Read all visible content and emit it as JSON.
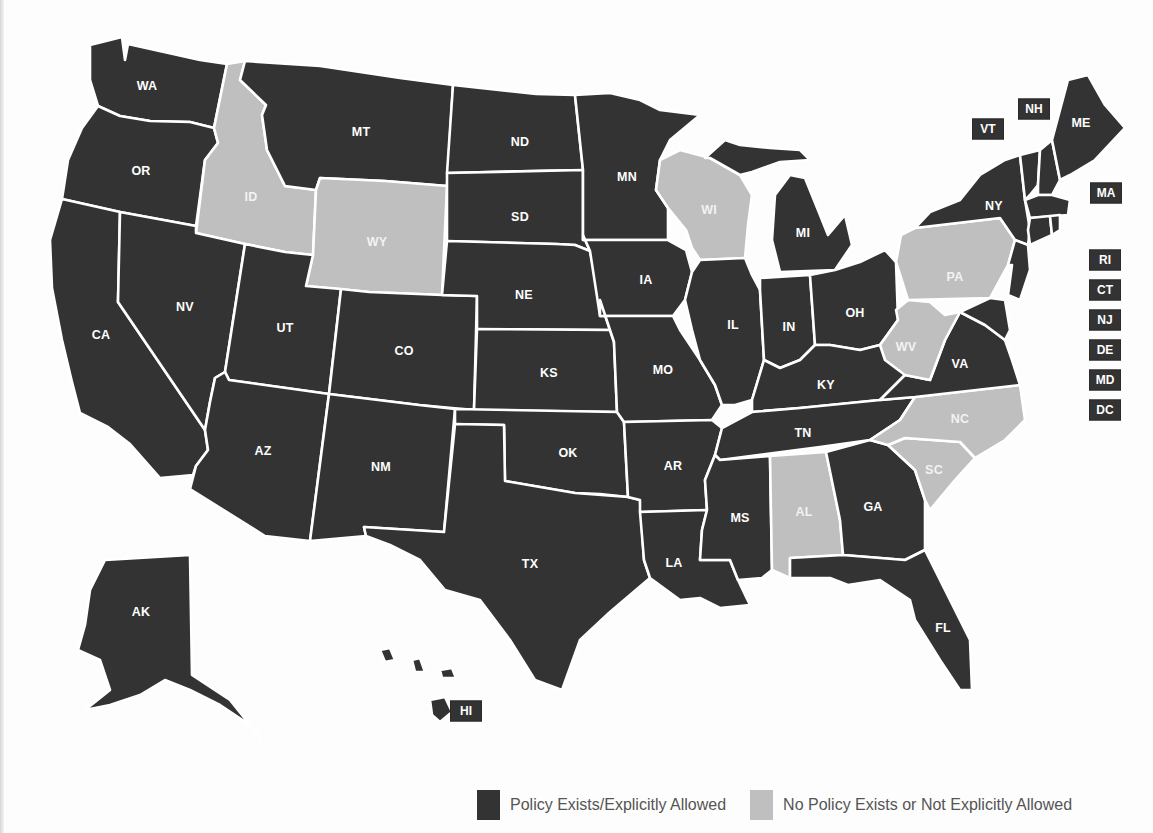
{
  "figure": {
    "title": "",
    "colors": {
      "policy_exists": "#333333",
      "no_policy": "#bfbfbf",
      "border": "#ffffff",
      "label_text": "#ffffff",
      "legend_text": "#555555"
    }
  },
  "legend": {
    "items": [
      {
        "key": "policy_exists",
        "label": "Policy Exists/Explicitly Allowed",
        "color": "#333333"
      },
      {
        "key": "no_policy",
        "label": "No Policy Exists or Not Explicitly Allowed",
        "color": "#bfbfbf"
      }
    ]
  },
  "chart_data": {
    "type": "choropleth",
    "title": "",
    "legend_position": "bottom-right",
    "categories": [
      "Policy Exists/Explicitly Allowed",
      "No Policy Exists or Not Explicitly Allowed"
    ],
    "states": [
      {
        "abbr": "WA",
        "status": "policy_exists"
      },
      {
        "abbr": "OR",
        "status": "policy_exists"
      },
      {
        "abbr": "CA",
        "status": "policy_exists"
      },
      {
        "abbr": "ID",
        "status": "no_policy"
      },
      {
        "abbr": "NV",
        "status": "policy_exists"
      },
      {
        "abbr": "MT",
        "status": "policy_exists"
      },
      {
        "abbr": "WY",
        "status": "no_policy"
      },
      {
        "abbr": "UT",
        "status": "policy_exists"
      },
      {
        "abbr": "AZ",
        "status": "policy_exists"
      },
      {
        "abbr": "CO",
        "status": "policy_exists"
      },
      {
        "abbr": "NM",
        "status": "policy_exists"
      },
      {
        "abbr": "ND",
        "status": "policy_exists"
      },
      {
        "abbr": "SD",
        "status": "policy_exists"
      },
      {
        "abbr": "NE",
        "status": "policy_exists"
      },
      {
        "abbr": "KS",
        "status": "policy_exists"
      },
      {
        "abbr": "OK",
        "status": "policy_exists"
      },
      {
        "abbr": "TX",
        "status": "policy_exists"
      },
      {
        "abbr": "MN",
        "status": "policy_exists"
      },
      {
        "abbr": "IA",
        "status": "policy_exists"
      },
      {
        "abbr": "MO",
        "status": "policy_exists"
      },
      {
        "abbr": "AR",
        "status": "policy_exists"
      },
      {
        "abbr": "LA",
        "status": "policy_exists"
      },
      {
        "abbr": "WI",
        "status": "no_policy"
      },
      {
        "abbr": "IL",
        "status": "policy_exists"
      },
      {
        "abbr": "MI",
        "status": "policy_exists"
      },
      {
        "abbr": "IN",
        "status": "policy_exists"
      },
      {
        "abbr": "OH",
        "status": "policy_exists"
      },
      {
        "abbr": "KY",
        "status": "policy_exists"
      },
      {
        "abbr": "TN",
        "status": "policy_exists"
      },
      {
        "abbr": "MS",
        "status": "policy_exists"
      },
      {
        "abbr": "AL",
        "status": "no_policy"
      },
      {
        "abbr": "GA",
        "status": "policy_exists"
      },
      {
        "abbr": "FL",
        "status": "policy_exists"
      },
      {
        "abbr": "SC",
        "status": "no_policy"
      },
      {
        "abbr": "NC",
        "status": "no_policy"
      },
      {
        "abbr": "VA",
        "status": "policy_exists"
      },
      {
        "abbr": "WV",
        "status": "no_policy"
      },
      {
        "abbr": "PA",
        "status": "no_policy"
      },
      {
        "abbr": "NY",
        "status": "policy_exists"
      },
      {
        "abbr": "ME",
        "status": "policy_exists"
      },
      {
        "abbr": "VT",
        "status": "policy_exists"
      },
      {
        "abbr": "NH",
        "status": "policy_exists"
      },
      {
        "abbr": "MA",
        "status": "policy_exists"
      },
      {
        "abbr": "RI",
        "status": "policy_exists"
      },
      {
        "abbr": "CT",
        "status": "policy_exists"
      },
      {
        "abbr": "NJ",
        "status": "policy_exists"
      },
      {
        "abbr": "DE",
        "status": "policy_exists"
      },
      {
        "abbr": "MD",
        "status": "policy_exists"
      },
      {
        "abbr": "DC",
        "status": "policy_exists"
      },
      {
        "abbr": "AK",
        "status": "policy_exists"
      },
      {
        "abbr": "HI",
        "status": "policy_exists"
      }
    ],
    "counts": {
      "policy_exists": 43,
      "no_policy": 8
    }
  },
  "map": {
    "labels": [
      {
        "abbr": "WA",
        "x": 147,
        "y": 86
      },
      {
        "abbr": "OR",
        "x": 141,
        "y": 171
      },
      {
        "abbr": "CA",
        "x": 101,
        "y": 335
      },
      {
        "abbr": "ID",
        "x": 251,
        "y": 197
      },
      {
        "abbr": "NV",
        "x": 185,
        "y": 307
      },
      {
        "abbr": "MT",
        "x": 361,
        "y": 132
      },
      {
        "abbr": "WY",
        "x": 377,
        "y": 242
      },
      {
        "abbr": "UT",
        "x": 285,
        "y": 328
      },
      {
        "abbr": "AZ",
        "x": 263,
        "y": 451
      },
      {
        "abbr": "CO",
        "x": 404,
        "y": 351
      },
      {
        "abbr": "NM",
        "x": 381,
        "y": 467
      },
      {
        "abbr": "ND",
        "x": 520,
        "y": 142
      },
      {
        "abbr": "SD",
        "x": 520,
        "y": 217
      },
      {
        "abbr": "NE",
        "x": 524,
        "y": 295
      },
      {
        "abbr": "KS",
        "x": 549,
        "y": 373
      },
      {
        "abbr": "OK",
        "x": 568,
        "y": 453
      },
      {
        "abbr": "TX",
        "x": 530,
        "y": 564
      },
      {
        "abbr": "MN",
        "x": 627,
        "y": 177
      },
      {
        "abbr": "IA",
        "x": 646,
        "y": 280
      },
      {
        "abbr": "MO",
        "x": 663,
        "y": 370
      },
      {
        "abbr": "AR",
        "x": 673,
        "y": 466
      },
      {
        "abbr": "LA",
        "x": 674,
        "y": 563
      },
      {
        "abbr": "WI",
        "x": 709,
        "y": 210
      },
      {
        "abbr": "IL",
        "x": 733,
        "y": 325
      },
      {
        "abbr": "MI",
        "x": 803,
        "y": 233
      },
      {
        "abbr": "IN",
        "x": 789,
        "y": 327
      },
      {
        "abbr": "OH",
        "x": 855,
        "y": 313
      },
      {
        "abbr": "KY",
        "x": 826,
        "y": 385
      },
      {
        "abbr": "TN",
        "x": 803,
        "y": 433
      },
      {
        "abbr": "MS",
        "x": 740,
        "y": 518
      },
      {
        "abbr": "AL",
        "x": 804,
        "y": 512
      },
      {
        "abbr": "GA",
        "x": 873,
        "y": 507
      },
      {
        "abbr": "FL",
        "x": 943,
        "y": 628
      },
      {
        "abbr": "SC",
        "x": 934,
        "y": 470
      },
      {
        "abbr": "NC",
        "x": 960,
        "y": 419
      },
      {
        "abbr": "VA",
        "x": 960,
        "y": 364
      },
      {
        "abbr": "WV",
        "x": 906,
        "y": 347
      },
      {
        "abbr": "PA",
        "x": 955,
        "y": 277
      },
      {
        "abbr": "NY",
        "x": 994,
        "y": 206
      },
      {
        "abbr": "ME",
        "x": 1081,
        "y": 123
      },
      {
        "abbr": "AK",
        "x": 141,
        "y": 612
      }
    ],
    "callouts": [
      {
        "abbr": "NH",
        "x": 1034,
        "y": 109
      },
      {
        "abbr": "VT",
        "x": 988,
        "y": 129
      },
      {
        "abbr": "MA",
        "x": 1106,
        "y": 193
      },
      {
        "abbr": "RI",
        "x": 1105,
        "y": 260
      },
      {
        "abbr": "CT",
        "x": 1105,
        "y": 290
      },
      {
        "abbr": "NJ",
        "x": 1105,
        "y": 320
      },
      {
        "abbr": "DE",
        "x": 1105,
        "y": 350
      },
      {
        "abbr": "MD",
        "x": 1105,
        "y": 380
      },
      {
        "abbr": "DC",
        "x": 1105,
        "y": 410
      },
      {
        "abbr": "HI",
        "x": 466,
        "y": 711
      }
    ]
  }
}
